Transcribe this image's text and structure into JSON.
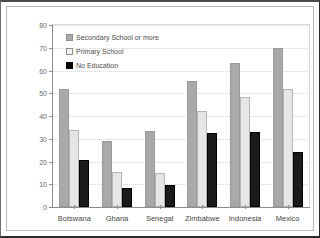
{
  "chart_data": {
    "type": "bar",
    "title": "",
    "xlabel": "",
    "ylabel": "",
    "ylim": [
      0,
      80
    ],
    "ytick_step": 10,
    "yticks": [
      "0",
      "10",
      "20",
      "30",
      "40",
      "50",
      "60",
      "70",
      "80"
    ],
    "grid": true,
    "legend_position": "top-left",
    "categories": [
      "Botswana",
      "Ghana",
      "Senegal",
      "Zimbabwe",
      "Indonesia",
      "Mexico"
    ],
    "series": [
      {
        "name": "Secondary School or more",
        "color": "#a9a9a9",
        "values": [
          52,
          29,
          33.5,
          55.5,
          63.5,
          70
        ]
      },
      {
        "name": "Primary School",
        "color": "#e6e6e6",
        "values": [
          34,
          15.5,
          15,
          42,
          48.5,
          52
        ]
      },
      {
        "name": "No Education",
        "color": "#1a1a1a",
        "values": [
          20.5,
          8.5,
          9.5,
          32.5,
          33,
          24
        ]
      }
    ]
  }
}
